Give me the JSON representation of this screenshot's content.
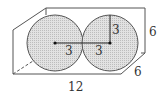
{
  "diagram": {
    "type": "box with two inscribed spheres",
    "labels": {
      "radius_left": "3",
      "radius_right_horizontal": "3",
      "radius_right_vertical": "3",
      "height": "6",
      "depth": "6",
      "length": "12"
    },
    "colors": {
      "stroke": "#555555",
      "sphere_fill": "#d9d9d9",
      "background": "#ffffff"
    }
  }
}
